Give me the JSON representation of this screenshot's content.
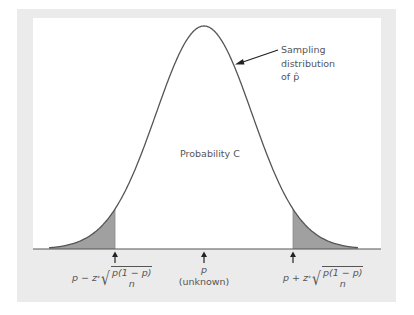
{
  "figure": {
    "callout_lines": [
      "Sampling",
      "distribution",
      "of p̂"
    ],
    "center_label": "Probability C",
    "mean_label": "p",
    "mean_sublabel": "(unknown)",
    "lower_bound": {
      "lead": "p − z",
      "star": "*",
      "numerator": "p(1 − p)",
      "denominator": "n"
    },
    "upper_bound": {
      "lead": "p + z",
      "star": "*",
      "numerator": "p(1 − p)",
      "denominator": "n"
    }
  },
  "colors": {
    "frame": "#ebebeb",
    "curve": "#555555",
    "shade": "#a0a0a0",
    "axis": "#555555"
  },
  "curve": {
    "mean_x": 204,
    "peak_y": 26,
    "baseline_y": 249,
    "sigma_px": 48,
    "x_start": 49,
    "x_end": 358,
    "lower_cut_x": 115,
    "upper_cut_x": 293
  }
}
